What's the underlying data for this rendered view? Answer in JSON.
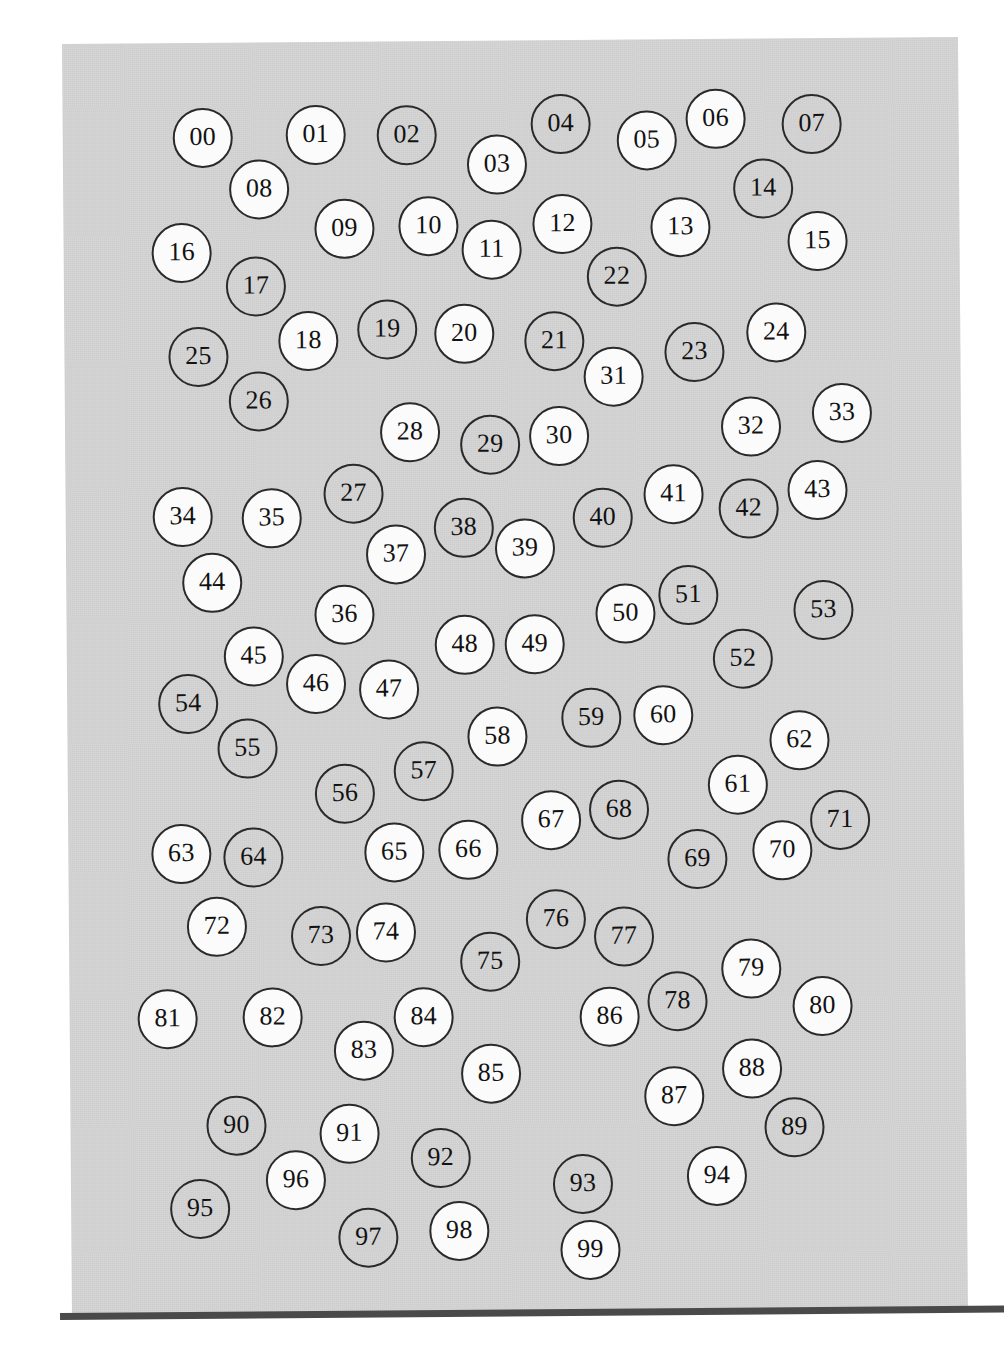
{
  "document": {
    "type": "scanned-page",
    "description": "Scanned gray page containing 100 numbered circles labelled 00 through 99",
    "page_background_color": "#d4d4d4",
    "circle_fill_white": "#fbfbfb",
    "circle_outline_color": "#2a2a2a",
    "bottom_edge_color": "#4a4a4a",
    "circle_count": 100
  },
  "circles": [
    {
      "label": "00",
      "fill": "white",
      "cx": 140,
      "cy": 95,
      "r": 30
    },
    {
      "label": "01",
      "fill": "white",
      "cx": 253,
      "cy": 93,
      "r": 30
    },
    {
      "label": "02",
      "fill": "gray",
      "cx": 344,
      "cy": 94,
      "r": 30
    },
    {
      "label": "03",
      "fill": "white",
      "cx": 434,
      "cy": 124,
      "r": 30
    },
    {
      "label": "04",
      "fill": "gray",
      "cx": 498,
      "cy": 84,
      "r": 30
    },
    {
      "label": "05",
      "fill": "white",
      "cx": 584,
      "cy": 101,
      "r": 30
    },
    {
      "label": "06",
      "fill": "white",
      "cx": 653,
      "cy": 80,
      "r": 30
    },
    {
      "label": "07",
      "fill": "gray",
      "cx": 749,
      "cy": 86,
      "r": 30
    },
    {
      "label": "08",
      "fill": "white",
      "cx": 196,
      "cy": 147,
      "r": 30
    },
    {
      "label": "09",
      "fill": "white",
      "cx": 281,
      "cy": 187,
      "r": 30
    },
    {
      "label": "10",
      "fill": "white",
      "cx": 365,
      "cy": 185,
      "r": 30
    },
    {
      "label": "11",
      "fill": "white",
      "cx": 428,
      "cy": 209,
      "r": 30
    },
    {
      "label": "12",
      "fill": "white",
      "cx": 499,
      "cy": 184,
      "r": 30
    },
    {
      "label": "13",
      "fill": "white",
      "cx": 617,
      "cy": 188,
      "r": 30
    },
    {
      "label": "14",
      "fill": "gray",
      "cx": 700,
      "cy": 150,
      "r": 30
    },
    {
      "label": "15",
      "fill": "white",
      "cx": 754,
      "cy": 203,
      "r": 30
    },
    {
      "label": "16",
      "fill": "white",
      "cx": 118,
      "cy": 210,
      "r": 30
    },
    {
      "label": "17",
      "fill": "gray",
      "cx": 192,
      "cy": 244,
      "r": 30
    },
    {
      "label": "18",
      "fill": "white",
      "cx": 244,
      "cy": 299,
      "r": 30
    },
    {
      "label": "19",
      "fill": "gray",
      "cx": 323,
      "cy": 288,
      "r": 30
    },
    {
      "label": "20",
      "fill": "white",
      "cx": 400,
      "cy": 293,
      "r": 30
    },
    {
      "label": "21",
      "fill": "gray",
      "cx": 490,
      "cy": 301,
      "r": 30
    },
    {
      "label": "22",
      "fill": "gray",
      "cx": 553,
      "cy": 237,
      "r": 30
    },
    {
      "label": "23",
      "fill": "gray",
      "cx": 630,
      "cy": 313,
      "r": 30
    },
    {
      "label": "24",
      "fill": "white",
      "cx": 712,
      "cy": 294,
      "r": 30
    },
    {
      "label": "25",
      "fill": "gray",
      "cx": 134,
      "cy": 314,
      "r": 30
    },
    {
      "label": "26",
      "fill": "gray",
      "cx": 194,
      "cy": 359,
      "r": 30
    },
    {
      "label": "27",
      "fill": "gray",
      "cx": 288,
      "cy": 452,
      "r": 30
    },
    {
      "label": "28",
      "fill": "white",
      "cx": 345,
      "cy": 391,
      "r": 30
    },
    {
      "label": "29",
      "fill": "gray",
      "cx": 425,
      "cy": 404,
      "r": 30
    },
    {
      "label": "30",
      "fill": "white",
      "cx": 494,
      "cy": 396,
      "r": 30
    },
    {
      "label": "31",
      "fill": "white",
      "cx": 549,
      "cy": 337,
      "r": 30
    },
    {
      "label": "32",
      "fill": "white",
      "cx": 686,
      "cy": 388,
      "r": 30
    },
    {
      "label": "33",
      "fill": "white",
      "cx": 777,
      "cy": 375,
      "r": 30
    },
    {
      "label": "34",
      "fill": "white",
      "cx": 117,
      "cy": 474,
      "r": 30
    },
    {
      "label": "35",
      "fill": "white",
      "cx": 206,
      "cy": 476,
      "r": 30
    },
    {
      "label": "36",
      "fill": "white",
      "cx": 278,
      "cy": 573,
      "r": 30
    },
    {
      "label": "37",
      "fill": "white",
      "cx": 330,
      "cy": 513,
      "r": 30
    },
    {
      "label": "38",
      "fill": "gray",
      "cx": 398,
      "cy": 487,
      "r": 30
    },
    {
      "label": "39",
      "fill": "white",
      "cx": 459,
      "cy": 508,
      "r": 30
    },
    {
      "label": "40",
      "fill": "gray",
      "cx": 537,
      "cy": 478,
      "r": 30
    },
    {
      "label": "41",
      "fill": "white",
      "cx": 608,
      "cy": 455,
      "r": 30
    },
    {
      "label": "42",
      "fill": "gray",
      "cx": 683,
      "cy": 470,
      "r": 30
    },
    {
      "label": "43",
      "fill": "white",
      "cx": 752,
      "cy": 452,
      "r": 30
    },
    {
      "label": "44",
      "fill": "white",
      "cx": 146,
      "cy": 540,
      "r": 30
    },
    {
      "label": "45",
      "fill": "white",
      "cx": 187,
      "cy": 614,
      "r": 30
    },
    {
      "label": "46",
      "fill": "white",
      "cx": 249,
      "cy": 642,
      "r": 30
    },
    {
      "label": "47",
      "fill": "white",
      "cx": 322,
      "cy": 648,
      "r": 30
    },
    {
      "label": "48",
      "fill": "white",
      "cx": 398,
      "cy": 604,
      "r": 30
    },
    {
      "label": "49",
      "fill": "white",
      "cx": 468,
      "cy": 604,
      "r": 30
    },
    {
      "label": "50",
      "fill": "white",
      "cx": 559,
      "cy": 574,
      "r": 30
    },
    {
      "label": "51",
      "fill": "gray",
      "cx": 622,
      "cy": 556,
      "r": 30
    },
    {
      "label": "52",
      "fill": "gray",
      "cx": 676,
      "cy": 620,
      "r": 30
    },
    {
      "label": "53",
      "fill": "gray",
      "cx": 757,
      "cy": 572,
      "r": 30
    },
    {
      "label": "54",
      "fill": "gray",
      "cx": 121,
      "cy": 661,
      "r": 30
    },
    {
      "label": "55",
      "fill": "gray",
      "cx": 180,
      "cy": 706,
      "r": 30
    },
    {
      "label": "56",
      "fill": "gray",
      "cx": 277,
      "cy": 752,
      "r": 30
    },
    {
      "label": "57",
      "fill": "gray",
      "cx": 356,
      "cy": 730,
      "r": 30
    },
    {
      "label": "58",
      "fill": "white",
      "cx": 430,
      "cy": 696,
      "r": 30
    },
    {
      "label": "59",
      "fill": "gray",
      "cx": 524,
      "cy": 678,
      "r": 30
    },
    {
      "label": "60",
      "fill": "white",
      "cx": 596,
      "cy": 676,
      "r": 30
    },
    {
      "label": "61",
      "fill": "white",
      "cx": 670,
      "cy": 746,
      "r": 30
    },
    {
      "label": "62",
      "fill": "white",
      "cx": 732,
      "cy": 702,
      "r": 30
    },
    {
      "label": "63",
      "fill": "white",
      "cx": 113,
      "cy": 811,
      "r": 30
    },
    {
      "label": "64",
      "fill": "gray",
      "cx": 185,
      "cy": 815,
      "r": 30
    },
    {
      "label": "65",
      "fill": "white",
      "cx": 326,
      "cy": 811,
      "r": 30
    },
    {
      "label": "66",
      "fill": "white",
      "cx": 400,
      "cy": 809,
      "r": 30
    },
    {
      "label": "67",
      "fill": "white",
      "cx": 483,
      "cy": 780,
      "r": 30
    },
    {
      "label": "68",
      "fill": "gray",
      "cx": 551,
      "cy": 770,
      "r": 30
    },
    {
      "label": "69",
      "fill": "gray",
      "cx": 629,
      "cy": 820,
      "r": 30
    },
    {
      "label": "70",
      "fill": "white",
      "cx": 714,
      "cy": 812,
      "r": 30
    },
    {
      "label": "71",
      "fill": "gray",
      "cx": 772,
      "cy": 782,
      "r": 30
    },
    {
      "label": "72",
      "fill": "white",
      "cx": 148,
      "cy": 884,
      "r": 30
    },
    {
      "label": "73",
      "fill": "gray",
      "cx": 252,
      "cy": 894,
      "r": 30
    },
    {
      "label": "74",
      "fill": "white",
      "cx": 317,
      "cy": 891,
      "r": 30
    },
    {
      "label": "75",
      "fill": "gray",
      "cx": 421,
      "cy": 921,
      "r": 30
    },
    {
      "label": "76",
      "fill": "gray",
      "cx": 487,
      "cy": 879,
      "r": 30
    },
    {
      "label": "77",
      "fill": "gray",
      "cx": 555,
      "cy": 897,
      "r": 30
    },
    {
      "label": "78",
      "fill": "gray",
      "cx": 608,
      "cy": 962,
      "r": 30
    },
    {
      "label": "79",
      "fill": "white",
      "cx": 682,
      "cy": 930,
      "r": 30
    },
    {
      "label": "80",
      "fill": "white",
      "cx": 753,
      "cy": 968,
      "r": 30
    },
    {
      "label": "81",
      "fill": "white",
      "cx": 98,
      "cy": 976,
      "r": 30
    },
    {
      "label": "82",
      "fill": "white",
      "cx": 203,
      "cy": 975,
      "r": 30
    },
    {
      "label": "83",
      "fill": "white",
      "cx": 294,
      "cy": 1009,
      "r": 30
    },
    {
      "label": "84",
      "fill": "white",
      "cx": 354,
      "cy": 976,
      "r": 30
    },
    {
      "label": "85",
      "fill": "white",
      "cx": 421,
      "cy": 1033,
      "r": 30
    },
    {
      "label": "86",
      "fill": "white",
      "cx": 540,
      "cy": 977,
      "r": 30
    },
    {
      "label": "87",
      "fill": "white",
      "cx": 604,
      "cy": 1057,
      "r": 30
    },
    {
      "label": "88",
      "fill": "white",
      "cx": 682,
      "cy": 1030,
      "r": 30
    },
    {
      "label": "89",
      "fill": "gray",
      "cx": 724,
      "cy": 1089,
      "r": 30
    },
    {
      "label": "90",
      "fill": "gray",
      "cx": 166,
      "cy": 1083,
      "r": 30
    },
    {
      "label": "91",
      "fill": "white",
      "cx": 279,
      "cy": 1092,
      "r": 30
    },
    {
      "label": "92",
      "fill": "gray",
      "cx": 370,
      "cy": 1117,
      "r": 30
    },
    {
      "label": "93",
      "fill": "gray",
      "cx": 512,
      "cy": 1144,
      "r": 30
    },
    {
      "label": "94",
      "fill": "white",
      "cx": 646,
      "cy": 1137,
      "r": 30
    },
    {
      "label": "95",
      "fill": "gray",
      "cx": 129,
      "cy": 1166,
      "r": 30
    },
    {
      "label": "96",
      "fill": "white",
      "cx": 225,
      "cy": 1138,
      "r": 30
    },
    {
      "label": "97",
      "fill": "gray",
      "cx": 297,
      "cy": 1196,
      "r": 30
    },
    {
      "label": "98",
      "fill": "white",
      "cx": 388,
      "cy": 1190,
      "r": 30
    },
    {
      "label": "99",
      "fill": "white",
      "cx": 519,
      "cy": 1210,
      "r": 30
    }
  ]
}
